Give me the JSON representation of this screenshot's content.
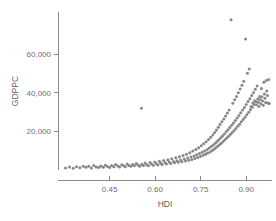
{
  "chart": {
    "background_color": "#ffffff",
    "axis_color": "#8a8a8a",
    "point_color": "#878787",
    "tick_label_color": "#6e6e6e"
  },
  "chart_data": {
    "type": "scatter",
    "title": "",
    "subtitle": "",
    "xlabel": "HDI",
    "ylabel": "GDPPC",
    "xlim": [
      0.28,
      0.985
    ],
    "ylim": [
      0,
      82000
    ],
    "grid": false,
    "legend": null,
    "legend_position": "none",
    "xticks": [
      0.45,
      0.6,
      0.75,
      0.9
    ],
    "xtick_labels": [
      "0.45",
      "0.60",
      "0.75",
      "0.90"
    ],
    "yticks": [
      20000,
      40000,
      60000
    ],
    "ytick_labels": [
      "20,000",
      "40,000",
      "60,000"
    ],
    "marker": "circle",
    "marker_size": 3,
    "marker_color": "#878787",
    "annotations": [],
    "points": [
      [
        0.305,
        1100
      ],
      [
        0.318,
        1500
      ],
      [
        0.33,
        900
      ],
      [
        0.341,
        1700
      ],
      [
        0.352,
        1200
      ],
      [
        0.363,
        2000
      ],
      [
        0.372,
        1400
      ],
      [
        0.381,
        1900
      ],
      [
        0.39,
        1000
      ],
      [
        0.398,
        2300
      ],
      [
        0.406,
        1600
      ],
      [
        0.414,
        1250
      ],
      [
        0.421,
        2100
      ],
      [
        0.429,
        1450
      ],
      [
        0.436,
        2500
      ],
      [
        0.443,
        1800
      ],
      [
        0.45,
        1350
      ],
      [
        0.457,
        2400
      ],
      [
        0.464,
        1700
      ],
      [
        0.47,
        2900
      ],
      [
        0.477,
        2050
      ],
      [
        0.483,
        1550
      ],
      [
        0.49,
        2700
      ],
      [
        0.496,
        2200
      ],
      [
        0.502,
        1750
      ],
      [
        0.508,
        3100
      ],
      [
        0.514,
        2350
      ],
      [
        0.52,
        1900
      ],
      [
        0.526,
        2800
      ],
      [
        0.532,
        2150
      ],
      [
        0.538,
        3400
      ],
      [
        0.543,
        2550
      ],
      [
        0.549,
        1950
      ],
      [
        0.555,
        32000
      ],
      [
        0.556,
        3000
      ],
      [
        0.561,
        2400
      ],
      [
        0.567,
        3600
      ],
      [
        0.572,
        2750
      ],
      [
        0.578,
        2200
      ],
      [
        0.583,
        3900
      ],
      [
        0.588,
        3050
      ],
      [
        0.594,
        2500
      ],
      [
        0.599,
        4200
      ],
      [
        0.604,
        3300
      ],
      [
        0.609,
        2650
      ],
      [
        0.614,
        4500
      ],
      [
        0.618,
        3550
      ],
      [
        0.623,
        2900
      ],
      [
        0.628,
        4900
      ],
      [
        0.633,
        3800
      ],
      [
        0.637,
        3150
      ],
      [
        0.642,
        5300
      ],
      [
        0.646,
        4100
      ],
      [
        0.651,
        3400
      ],
      [
        0.655,
        5800
      ],
      [
        0.66,
        4400
      ],
      [
        0.664,
        3700
      ],
      [
        0.668,
        6300
      ],
      [
        0.672,
        4800
      ],
      [
        0.676,
        4000
      ],
      [
        0.68,
        6900
      ],
      [
        0.684,
        5200
      ],
      [
        0.688,
        4300
      ],
      [
        0.692,
        7500
      ],
      [
        0.696,
        5700
      ],
      [
        0.7,
        4700
      ],
      [
        0.703,
        8200
      ],
      [
        0.707,
        6200
      ],
      [
        0.711,
        5100
      ],
      [
        0.714,
        9000
      ],
      [
        0.718,
        6700
      ],
      [
        0.721,
        5500
      ],
      [
        0.724,
        9800
      ],
      [
        0.728,
        7300
      ],
      [
        0.731,
        6000
      ],
      [
        0.734,
        10700
      ],
      [
        0.737,
        7900
      ],
      [
        0.74,
        6500
      ],
      [
        0.743,
        11600
      ],
      [
        0.746,
        8500
      ],
      [
        0.749,
        7000
      ],
      [
        0.752,
        12600
      ],
      [
        0.755,
        9200
      ],
      [
        0.758,
        7600
      ],
      [
        0.76,
        13600
      ],
      [
        0.763,
        9900
      ],
      [
        0.766,
        8200
      ],
      [
        0.768,
        14700
      ],
      [
        0.771,
        10600
      ],
      [
        0.773,
        8800
      ],
      [
        0.776,
        15800
      ],
      [
        0.778,
        11400
      ],
      [
        0.781,
        9400
      ],
      [
        0.783,
        17000
      ],
      [
        0.785,
        12200
      ],
      [
        0.788,
        10100
      ],
      [
        0.79,
        18200
      ],
      [
        0.792,
        13000
      ],
      [
        0.794,
        10800
      ],
      [
        0.796,
        19500
      ],
      [
        0.798,
        13900
      ],
      [
        0.8,
        11500
      ],
      [
        0.802,
        20800
      ],
      [
        0.804,
        14800
      ],
      [
        0.806,
        12300
      ],
      [
        0.808,
        22200
      ],
      [
        0.81,
        15700
      ],
      [
        0.812,
        13100
      ],
      [
        0.814,
        23600
      ],
      [
        0.816,
        16700
      ],
      [
        0.818,
        13900
      ],
      [
        0.82,
        25000
      ],
      [
        0.822,
        17700
      ],
      [
        0.824,
        14800
      ],
      [
        0.826,
        26500
      ],
      [
        0.828,
        18700
      ],
      [
        0.83,
        15700
      ],
      [
        0.832,
        28000
      ],
      [
        0.834,
        19800
      ],
      [
        0.836,
        16600
      ],
      [
        0.838,
        29600
      ],
      [
        0.84,
        20900
      ],
      [
        0.842,
        17500
      ],
      [
        0.844,
        31200
      ],
      [
        0.846,
        22000
      ],
      [
        0.848,
        18500
      ],
      [
        0.85,
        78000
      ],
      [
        0.852,
        23200
      ],
      [
        0.854,
        19500
      ],
      [
        0.856,
        34600
      ],
      [
        0.858,
        24400
      ],
      [
        0.86,
        20500
      ],
      [
        0.862,
        36400
      ],
      [
        0.864,
        25700
      ],
      [
        0.866,
        21600
      ],
      [
        0.868,
        38200
      ],
      [
        0.87,
        27000
      ],
      [
        0.872,
        22700
      ],
      [
        0.874,
        40100
      ],
      [
        0.876,
        28300
      ],
      [
        0.878,
        23800
      ],
      [
        0.88,
        42000
      ],
      [
        0.882,
        29700
      ],
      [
        0.884,
        25000
      ],
      [
        0.886,
        44000
      ],
      [
        0.888,
        31100
      ],
      [
        0.89,
        26200
      ],
      [
        0.892,
        46000
      ],
      [
        0.894,
        32500
      ],
      [
        0.896,
        27400
      ],
      [
        0.898,
        68000
      ],
      [
        0.9,
        34000
      ],
      [
        0.902,
        28700
      ],
      [
        0.904,
        50200
      ],
      [
        0.906,
        35500
      ],
      [
        0.908,
        30000
      ],
      [
        0.91,
        52400
      ],
      [
        0.912,
        37000
      ],
      [
        0.914,
        31300
      ],
      [
        0.916,
        33000
      ],
      [
        0.918,
        38600
      ],
      [
        0.92,
        32600
      ],
      [
        0.922,
        34800
      ],
      [
        0.924,
        40200
      ],
      [
        0.926,
        34000
      ],
      [
        0.928,
        36000
      ],
      [
        0.93,
        41900
      ],
      [
        0.932,
        35400
      ],
      [
        0.934,
        33800
      ],
      [
        0.936,
        43600
      ],
      [
        0.938,
        36800
      ],
      [
        0.94,
        35200
      ],
      [
        0.942,
        33000
      ],
      [
        0.944,
        38200
      ],
      [
        0.946,
        36600
      ],
      [
        0.948,
        34400
      ],
      [
        0.95,
        42300
      ],
      [
        0.952,
        38000
      ],
      [
        0.954,
        35800
      ],
      [
        0.956,
        33600
      ],
      [
        0.958,
        45600
      ],
      [
        0.96,
        39500
      ],
      [
        0.962,
        37200
      ],
      [
        0.964,
        35000
      ],
      [
        0.966,
        46500
      ],
      [
        0.968,
        41000
      ],
      [
        0.97,
        38600
      ],
      [
        0.972,
        34800
      ],
      [
        0.974,
        47000
      ],
      [
        0.976,
        34500
      ]
    ]
  }
}
